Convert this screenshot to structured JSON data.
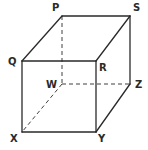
{
  "diagram": {
    "type": "cube",
    "colors": {
      "line": "#2a2a2a",
      "background": "#ffffff"
    },
    "vertices": {
      "P": {
        "label": "P",
        "x": 62,
        "y": 16,
        "lx": 52,
        "ly": 11
      },
      "S": {
        "label": "S",
        "x": 130,
        "y": 16,
        "lx": 133,
        "ly": 11
      },
      "Q": {
        "label": "Q",
        "x": 22,
        "y": 61,
        "lx": 8,
        "ly": 65
      },
      "R": {
        "label": "R",
        "x": 96,
        "y": 61,
        "lx": 99,
        "ly": 71
      },
      "W": {
        "label": "W",
        "x": 62,
        "y": 84,
        "lx": 46,
        "ly": 88
      },
      "Z": {
        "label": "Z",
        "x": 130,
        "y": 84,
        "lx": 135,
        "ly": 88
      },
      "X": {
        "label": "X",
        "x": 22,
        "y": 132,
        "lx": 10,
        "ly": 142
      },
      "Y": {
        "label": "Y",
        "x": 96,
        "y": 132,
        "lx": 98,
        "ly": 142
      }
    },
    "solid_edges": [
      [
        "Q",
        "R"
      ],
      [
        "R",
        "Y"
      ],
      [
        "Y",
        "X"
      ],
      [
        "X",
        "Q"
      ],
      [
        "P",
        "S"
      ],
      [
        "Q",
        "P"
      ],
      [
        "R",
        "S"
      ],
      [
        "S",
        "Z"
      ],
      [
        "Y",
        "Z"
      ]
    ],
    "dashed_edges": [
      [
        "P",
        "W"
      ],
      [
        "W",
        "Z"
      ],
      [
        "W",
        "X"
      ]
    ]
  }
}
